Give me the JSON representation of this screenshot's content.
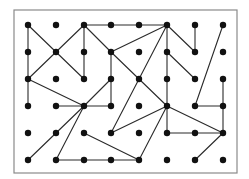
{
  "diagram": {
    "type": "dot-grid-graph",
    "frame": {
      "x": 14,
      "y": 10,
      "width": 223,
      "height": 163,
      "stroke": "#8a8a8a"
    },
    "grid": {
      "columns": 8,
      "rows": 6,
      "col_x": [
        28,
        56,
        84,
        111,
        139,
        167,
        195,
        223
      ],
      "row_y": [
        25,
        52,
        79,
        106,
        133,
        160
      ]
    },
    "node_radius": 3.2,
    "node_color": "#111111",
    "edge_color": "#2a2a2a",
    "edges": [
      [
        [
          0,
          0
        ],
        [
          0,
          1
        ]
      ],
      [
        [
          0,
          1
        ],
        [
          0,
          2
        ]
      ],
      [
        [
          0,
          2
        ],
        [
          0,
          3
        ]
      ],
      [
        [
          0,
          0
        ],
        [
          1,
          1
        ]
      ],
      [
        [
          1,
          1
        ],
        [
          2,
          2
        ]
      ],
      [
        [
          1,
          1
        ],
        [
          2,
          0
        ]
      ],
      [
        [
          1,
          1
        ],
        [
          0,
          2
        ]
      ],
      [
        [
          2,
          0
        ],
        [
          2,
          1
        ]
      ],
      [
        [
          2,
          1
        ],
        [
          2,
          2
        ]
      ],
      [
        [
          2,
          0
        ],
        [
          3,
          0
        ]
      ],
      [
        [
          3,
          0
        ],
        [
          4,
          0
        ]
      ],
      [
        [
          4,
          0
        ],
        [
          5,
          0
        ]
      ],
      [
        [
          2,
          0
        ],
        [
          3,
          1
        ]
      ],
      [
        [
          5,
          0
        ],
        [
          3,
          1
        ]
      ],
      [
        [
          3,
          1
        ],
        [
          3,
          2
        ]
      ],
      [
        [
          3,
          2
        ],
        [
          3,
          3
        ]
      ],
      [
        [
          3,
          1
        ],
        [
          4,
          2
        ]
      ],
      [
        [
          3,
          2
        ],
        [
          2,
          3
        ]
      ],
      [
        [
          0,
          2
        ],
        [
          2,
          3
        ]
      ],
      [
        [
          1,
          3
        ],
        [
          2,
          3
        ]
      ],
      [
        [
          2,
          3
        ],
        [
          3,
          3
        ]
      ],
      [
        [
          2,
          3
        ],
        [
          1,
          4
        ]
      ],
      [
        [
          1,
          4
        ],
        [
          0,
          5
        ]
      ],
      [
        [
          2,
          3
        ],
        [
          1,
          5
        ]
      ],
      [
        [
          1,
          5
        ],
        [
          2,
          5
        ]
      ],
      [
        [
          2,
          5
        ],
        [
          3,
          5
        ]
      ],
      [
        [
          3,
          5
        ],
        [
          4,
          5
        ]
      ],
      [
        [
          2,
          4
        ],
        [
          4,
          5
        ]
      ],
      [
        [
          5,
          0
        ],
        [
          4,
          2
        ]
      ],
      [
        [
          4,
          2
        ],
        [
          3,
          4
        ]
      ],
      [
        [
          3,
          4
        ],
        [
          5,
          3
        ]
      ],
      [
        [
          4,
          2
        ],
        [
          5,
          3
        ]
      ],
      [
        [
          5,
          3
        ],
        [
          4,
          5
        ]
      ],
      [
        [
          5,
          0
        ],
        [
          5,
          1
        ]
      ],
      [
        [
          5,
          1
        ],
        [
          5,
          2
        ]
      ],
      [
        [
          5,
          2
        ],
        [
          5,
          3
        ]
      ],
      [
        [
          5,
          3
        ],
        [
          5,
          4
        ]
      ],
      [
        [
          5,
          0
        ],
        [
          6,
          1
        ]
      ],
      [
        [
          6,
          0
        ],
        [
          6,
          1
        ]
      ],
      [
        [
          5,
          1
        ],
        [
          6,
          2
        ]
      ],
      [
        [
          7,
          0
        ],
        [
          6,
          3
        ]
      ],
      [
        [
          6,
          3
        ],
        [
          7,
          3
        ]
      ],
      [
        [
          7,
          2
        ],
        [
          7,
          3
        ]
      ],
      [
        [
          7,
          3
        ],
        [
          7,
          4
        ]
      ],
      [
        [
          5,
          3
        ],
        [
          7,
          4
        ]
      ],
      [
        [
          5,
          4
        ],
        [
          6,
          4
        ]
      ],
      [
        [
          6,
          4
        ],
        [
          7,
          4
        ]
      ],
      [
        [
          7,
          4
        ],
        [
          6,
          5
        ]
      ]
    ]
  }
}
